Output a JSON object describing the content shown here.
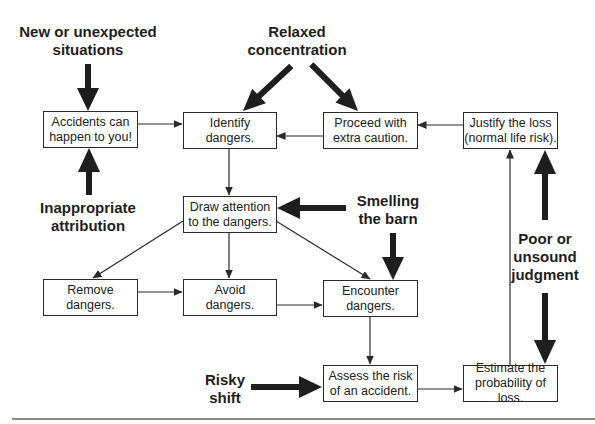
{
  "diagram": {
    "boxes": {
      "accidents": "Accidents can\nhappen to you!",
      "identify": "Identify\ndangers.",
      "proceed": "Proceed with\nextra caution.",
      "justify": "Justify the loss\n(normal life risk).",
      "draw_attention": "Draw attention\nto the dangers.",
      "remove": "Remove\ndangers.",
      "avoid": "Avoid\ndangers.",
      "encounter": "Encounter\ndangers.",
      "assess": "Assess the risk\nof an accident.",
      "estimate": "Estimate the\nprobability of loss."
    },
    "influences": {
      "new_situations": "New or unexpected\nsituations",
      "relaxed": "Relaxed\nconcentration",
      "inappropriate": "Inappropriate\nattribution",
      "smelling": "Smelling\nthe barn",
      "poor_judgment": "Poor or\nunsound\njudgment",
      "risky_shift": "Risky\nshift"
    },
    "edges": [
      [
        "accidents",
        "identify"
      ],
      [
        "proceed",
        "identify"
      ],
      [
        "justify",
        "proceed"
      ],
      [
        "identify",
        "draw_attention"
      ],
      [
        "draw_attention",
        "remove"
      ],
      [
        "draw_attention",
        "avoid"
      ],
      [
        "draw_attention",
        "encounter"
      ],
      [
        "remove",
        "avoid"
      ],
      [
        "avoid",
        "encounter"
      ],
      [
        "encounter",
        "assess"
      ],
      [
        "assess",
        "estimate"
      ],
      [
        "estimate",
        "justify"
      ]
    ],
    "influence_edges": [
      [
        "new_situations",
        "accidents"
      ],
      [
        "inappropriate",
        "accidents"
      ],
      [
        "relaxed",
        "identify"
      ],
      [
        "relaxed",
        "proceed"
      ],
      [
        "smelling",
        "draw_attention"
      ],
      [
        "smelling",
        "encounter"
      ],
      [
        "poor_judgment",
        "justify"
      ],
      [
        "poor_judgment",
        "estimate"
      ],
      [
        "risky_shift",
        "assess"
      ]
    ],
    "colors": {
      "line": "#2a2a2a",
      "thick_arrow": "#1e1e1e",
      "rule": "#8a8a8a"
    }
  }
}
